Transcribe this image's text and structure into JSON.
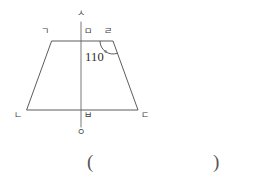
{
  "figure": {
    "type": "geometry-diagram",
    "shape": "trapezoid",
    "background_color": "#ffffff",
    "line_color": "#4a4a4a",
    "axis_color": "#6a6a6a",
    "vertices": [
      {
        "id": "g",
        "label": "ㄱ",
        "name": "vertex-top-left",
        "x": 52,
        "y": 41,
        "label_x": 41,
        "label_y": 27
      },
      {
        "id": "n",
        "label": "ㄴ",
        "name": "vertex-bottom-left",
        "x": 27,
        "y": 110,
        "label_x": 14,
        "label_y": 111
      },
      {
        "id": "d",
        "label": "ㄷ",
        "name": "vertex-bottom-right",
        "x": 138,
        "y": 110,
        "label_x": 141,
        "label_y": 111
      },
      {
        "id": "r",
        "label": "ㄹ",
        "name": "vertex-top-right",
        "x": 113,
        "y": 41,
        "label_x": 104,
        "label_y": 27
      },
      {
        "id": "m",
        "label": "ㅁ",
        "name": "point-top-midline",
        "x": 81,
        "y": 41,
        "label_x": 84,
        "label_y": 27
      },
      {
        "id": "b",
        "label": "ㅂ",
        "name": "point-bottom-midline",
        "x": 81,
        "y": 110,
        "label_x": 84,
        "label_y": 111
      },
      {
        "id": "s",
        "label": "ㅅ",
        "name": "point-axis-top",
        "x": 81,
        "y": 22,
        "label_x": 77,
        "label_y": 9
      },
      {
        "id": "o",
        "label": "ㅇ",
        "name": "point-axis-bottom",
        "x": 81,
        "y": 127,
        "label_x": 77,
        "label_y": 128
      }
    ],
    "edges": [
      {
        "name": "edge-top-left",
        "from": "g",
        "to": "m"
      },
      {
        "name": "edge-top-right",
        "from": "m",
        "to": "r"
      },
      {
        "name": "edge-right-side",
        "from": "r",
        "to": "d"
      },
      {
        "name": "edge-bottom-right",
        "from": "d",
        "to": "b"
      },
      {
        "name": "edge-bottom-left",
        "from": "b",
        "to": "n"
      },
      {
        "name": "edge-left-side",
        "from": "n",
        "to": "g"
      }
    ],
    "axis": {
      "name": "symmetry-axis",
      "x": 81,
      "y1": 22,
      "y2": 127
    },
    "angle": {
      "name": "angle-at-vertex-r",
      "at_vertex": "r",
      "value": "110",
      "degree_symbol": "°",
      "text": "110°",
      "label_x": 85,
      "label_y": 47,
      "arc_radius": 13
    }
  },
  "answer": {
    "open_paren": "(",
    "close_paren": ")",
    "open_x": 87,
    "close_x": 213,
    "y": 152
  }
}
